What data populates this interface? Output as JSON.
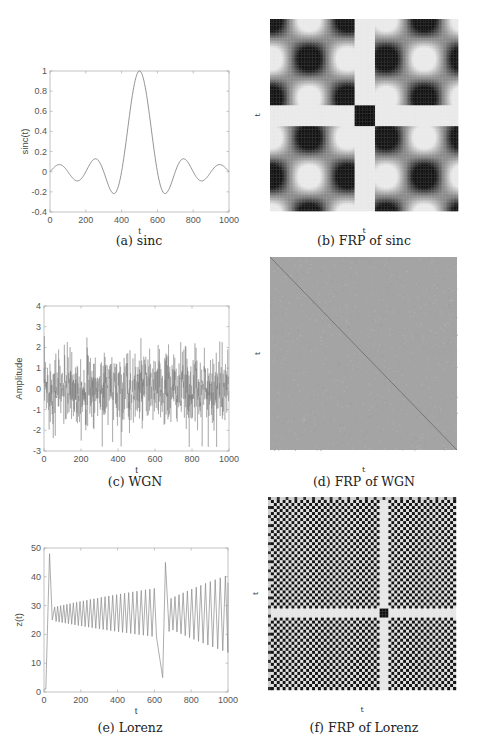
{
  "chart_data": [
    {
      "id": "a",
      "type": "line",
      "caption": "(a) sinc",
      "title": "",
      "xlabel": "t",
      "ylabel": "sinc(t)",
      "xlim": [
        0,
        1000
      ],
      "ylim": [
        -0.4,
        1
      ],
      "xticks": [
        0,
        200,
        400,
        600,
        800,
        1000
      ],
      "yticks": [
        -0.4,
        -0.2,
        0,
        0.2,
        0.4,
        0.6,
        0.8,
        1
      ],
      "ytick_labels": [
        "-0.4",
        "-0.2",
        "0",
        "0.2",
        "0.4",
        "0.6",
        "0.8",
        "1"
      ],
      "grid": false,
      "series": [
        {
          "name": "sinc",
          "function": "sinc((t-500)/100)",
          "x": [
            0,
            50,
            100,
            150,
            200,
            250,
            300,
            350,
            400,
            450,
            500,
            550,
            600,
            650,
            700,
            750,
            800,
            850,
            900,
            950,
            1000
          ],
          "values": [
            0,
            0.07,
            0,
            -0.09,
            0,
            0.13,
            0,
            -0.21,
            0,
            0.64,
            1,
            0.64,
            0,
            -0.21,
            0,
            0.13,
            0,
            -0.09,
            0,
            0.07,
            0
          ]
        }
      ],
      "color": "#7a7a7a"
    },
    {
      "id": "b",
      "type": "heatmap",
      "caption": "(b) FRP of sinc",
      "xlabel": "t",
      "ylabel": "t",
      "description": "Checkerboard recurrence plot, 10x10 blocks with a white cross and dark central block",
      "grid_cells": 10,
      "colors": {
        "dark": "#111111",
        "light": "#f2f2f2",
        "mid": "#9a9a9a"
      }
    },
    {
      "id": "c",
      "type": "line",
      "caption": "(c) WGN",
      "xlabel": "t",
      "ylabel": "Amplitude",
      "xlim": [
        0,
        1000
      ],
      "ylim": [
        -3,
        4
      ],
      "xticks": [
        0,
        200,
        400,
        600,
        800,
        1000
      ],
      "yticks": [
        -3,
        -2,
        -1,
        0,
        1,
        2,
        3,
        4
      ],
      "ytick_labels": [
        "-3",
        "-2",
        "-1",
        "0",
        "1",
        "2",
        "3",
        "4"
      ],
      "grid": false,
      "series": [
        {
          "name": "white gaussian noise",
          "n_points": 1000,
          "mean": 0,
          "std": 1,
          "observed_max": 3.3,
          "observed_min": -2.8
        }
      ],
      "color": "#6e6e6e"
    },
    {
      "id": "d",
      "type": "heatmap",
      "caption": "(d) FRP of WGN",
      "xlabel": "t",
      "ylabel": "t",
      "description": "Uniform mid-gray noise texture with a faint dark main diagonal",
      "colors": {
        "base": "#a4a4a4",
        "diagonal": "#6a6a6a"
      }
    },
    {
      "id": "e",
      "type": "line",
      "caption": "(e) Lorenz",
      "xlabel": "t",
      "ylabel": "z(t)",
      "xlim": [
        0,
        1000
      ],
      "ylim": [
        0,
        50
      ],
      "xticks": [
        0,
        200,
        400,
        600,
        800,
        1000
      ],
      "yticks": [
        0,
        10,
        20,
        30,
        40,
        50
      ],
      "ytick_labels": [
        "0",
        "10",
        "20",
        "30",
        "40",
        "50"
      ],
      "grid": false,
      "series": [
        {
          "name": "z(t)",
          "x": [
            0,
            10,
            30,
            50,
            60,
            300,
            520,
            560,
            590,
            645,
            660,
            680,
            700,
            850,
            900,
            930,
            960,
            980,
            1000
          ],
          "values": [
            1,
            1,
            48,
            25,
            29,
            31,
            35,
            14,
            38,
            5,
            45,
            21,
            32,
            35,
            37,
            12,
            40,
            14,
            38
          ]
        }
      ],
      "color": "#8a8a8a"
    },
    {
      "id": "f",
      "type": "heatmap",
      "caption": "(f) FRP of Lorenz",
      "xlabel": "t",
      "ylabel": "t",
      "description": "Dense fine checkerboard with white cross near t~640 and dark center block",
      "colors": {
        "dark": "#151515",
        "light": "#f0f0f0"
      }
    }
  ]
}
